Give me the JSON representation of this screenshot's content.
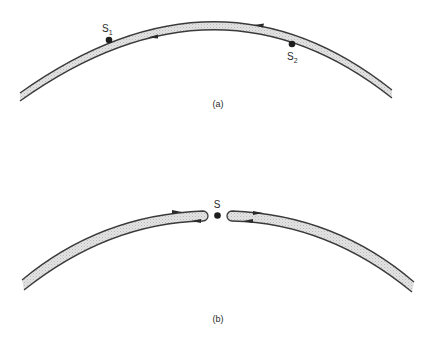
{
  "figure": {
    "panel_a": {
      "caption": "(a)",
      "sources": [
        {
          "name": "S",
          "subscript": "1"
        },
        {
          "name": "S",
          "subscript": "2"
        }
      ]
    },
    "panel_b": {
      "caption": "(b)",
      "source": {
        "name": "S"
      }
    }
  },
  "colors": {
    "stroke": "#3a3a3a",
    "band_fill": "#d9d9d9",
    "dot": "#1e1e1e"
  }
}
